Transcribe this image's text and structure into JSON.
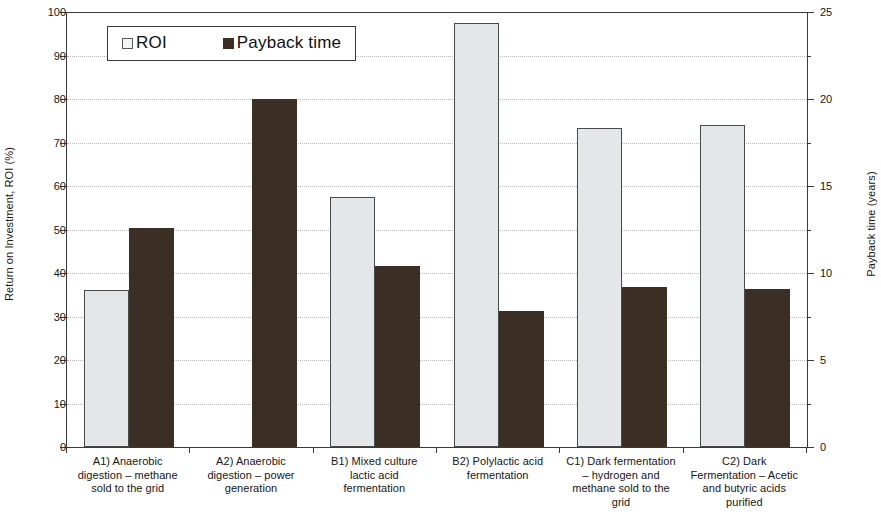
{
  "chart_data": {
    "type": "bar",
    "title": "",
    "xlabel": "",
    "ylabel": "Return on Investment, ROI (%)",
    "y2label": "Payback time (years)",
    "ylim": [
      0,
      100
    ],
    "y2lim": [
      0,
      25
    ],
    "ytick_step": 10,
    "y2tick_step": 5,
    "y2minor_step": 2.5,
    "grid": true,
    "legend_position": "top-left-inside",
    "categories": [
      "A1) Anaerobic digestion – methane sold to the grid",
      "A2) Anaerobic digestion – power generation",
      "B1) Mixed culture lactic acid fermentation",
      "B2) Polylactic acid fermentation",
      "C1) Dark fermentation – hydrogen and methane sold to the grid",
      "C2) Dark Fermentation – Acetic and butyric acids purified"
    ],
    "category_lines": [
      [
        "A1) Anaerobic",
        "digestion – methane",
        "sold to the grid"
      ],
      [
        "A2) Anaerobic",
        "digestion – power",
        "generation"
      ],
      [
        "B1) Mixed culture",
        "lactic acid",
        "fermentation"
      ],
      [
        "B2) Polylactic acid",
        "fermentation"
      ],
      [
        "C1) Dark fermentation",
        "– hydrogen and",
        "methane sold to the",
        "grid"
      ],
      [
        "C2) Dark",
        "Fermentation – Acetic",
        "and butyric acids",
        "purified"
      ]
    ],
    "series": [
      {
        "name": "ROI",
        "axis": "left",
        "unit": "%",
        "color": "#e3e7e9",
        "values": [
          36.0,
          null,
          57.5,
          97.5,
          73.3,
          74.0
        ]
      },
      {
        "name": "Payback time",
        "axis": "right",
        "unit": "years",
        "color": "#3b2f23",
        "values": [
          12.6,
          20.0,
          10.4,
          7.8,
          9.2,
          9.1
        ]
      }
    ],
    "ytick_labels": [
      "0",
      "10",
      "20",
      "30",
      "40",
      "50",
      "60",
      "70",
      "80",
      "90",
      "100"
    ],
    "ytick_values": [
      0,
      10,
      20,
      30,
      40,
      50,
      60,
      70,
      80,
      90,
      100
    ],
    "y2tick_labels": [
      "0",
      "5",
      "10",
      "15",
      "20",
      "25"
    ],
    "y2tick_values": [
      0,
      5,
      10,
      15,
      20,
      25
    ],
    "y2minor_values": [
      2.5,
      7.5,
      12.5,
      17.5,
      22.5
    ]
  },
  "legend": {
    "items": [
      {
        "label": "ROI",
        "swatch": "roi"
      },
      {
        "label": "Payback time",
        "swatch": "payback"
      }
    ]
  },
  "axes": {
    "left_title": "Return on Investment, ROI (%)",
    "right_title": "Payback time (years)"
  }
}
